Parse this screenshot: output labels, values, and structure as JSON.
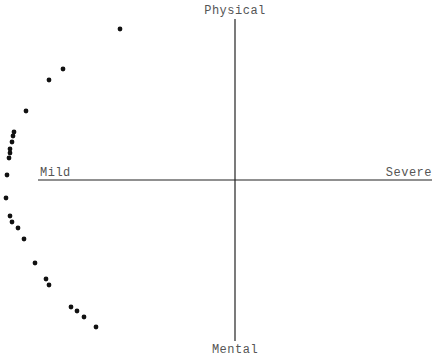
{
  "chart_data": {
    "type": "scatter",
    "title": "",
    "quadrant_labels": {
      "top": "Physical",
      "bottom": "Mental",
      "left": "Mild",
      "right": "Severe"
    },
    "xlabel": "Mild ↔ Severe",
    "ylabel": "Mental ↔ Physical",
    "grid": false,
    "legend": null,
    "axes_origin_px": [
      235,
      180
    ],
    "xlim": [
      -1,
      1
    ],
    "ylim": [
      -1,
      1
    ],
    "points": [
      {
        "x": -0.58,
        "y": 0.94
      },
      {
        "x": -0.87,
        "y": 0.69
      },
      {
        "x": -0.94,
        "y": 0.63
      },
      {
        "x": -1.06,
        "y": 0.43
      },
      {
        "x": -1.12,
        "y": 0.3
      },
      {
        "x": -1.12,
        "y": 0.28
      },
      {
        "x": -1.13,
        "y": 0.24
      },
      {
        "x": -1.14,
        "y": 0.19
      },
      {
        "x": -1.14,
        "y": 0.17
      },
      {
        "x": -1.15,
        "y": 0.14
      },
      {
        "x": -1.16,
        "y": 0.03
      },
      {
        "x": -1.16,
        "y": -0.11
      },
      {
        "x": -1.14,
        "y": -0.23
      },
      {
        "x": -1.13,
        "y": -0.26
      },
      {
        "x": -1.1,
        "y": -0.3
      },
      {
        "x": -1.07,
        "y": -0.37
      },
      {
        "x": -1.02,
        "y": -0.52
      },
      {
        "x": -0.96,
        "y": -0.62
      },
      {
        "x": -0.95,
        "y": -0.66
      },
      {
        "x": -0.83,
        "y": -0.79
      },
      {
        "x": -0.8,
        "y": -0.82
      },
      {
        "x": -0.77,
        "y": -0.86
      },
      {
        "x": -0.71,
        "y": -0.92
      }
    ],
    "points_px": [
      [
        120,
        29
      ],
      [
        63,
        69
      ],
      [
        49,
        80
      ],
      [
        26,
        111
      ],
      [
        14,
        132
      ],
      [
        13,
        136
      ],
      [
        12,
        142
      ],
      [
        10,
        149
      ],
      [
        10,
        153
      ],
      [
        9,
        158
      ],
      [
        7,
        175
      ],
      [
        6,
        198
      ],
      [
        10,
        216
      ],
      [
        12,
        222
      ],
      [
        18,
        228
      ],
      [
        24,
        239
      ],
      [
        35,
        263
      ],
      [
        46,
        279
      ],
      [
        49,
        285
      ],
      [
        71,
        307
      ],
      [
        77,
        311
      ],
      [
        84,
        317
      ],
      [
        96,
        327
      ]
    ]
  }
}
